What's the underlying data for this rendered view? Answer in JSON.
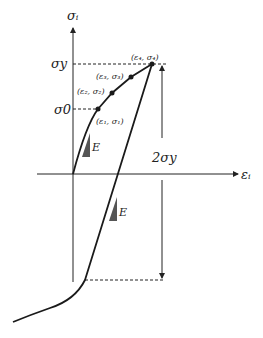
{
  "diagram": {
    "type": "stress-strain hysteresis diagram",
    "axes": {
      "y_label": "σᵢ",
      "x_label": "εᵢ"
    },
    "levels": {
      "yield_label": "σy",
      "initial_label": "σ0",
      "range_label": "2σy"
    },
    "points": [
      {
        "label": "(ε₁, σ₁)"
      },
      {
        "label": "(ε₂, σ₂)"
      },
      {
        "label": "(ε₃, σ₃)"
      },
      {
        "label": "(ε₄, σ₄)"
      }
    ],
    "slope_labels": [
      "E",
      "E"
    ],
    "colors": {
      "line": "#1a1a1a",
      "triangle": "#555555"
    }
  }
}
